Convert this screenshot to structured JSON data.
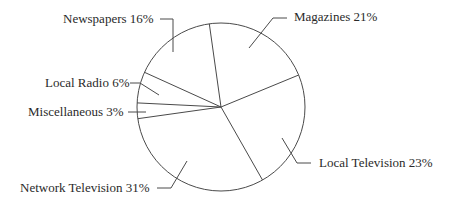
{
  "chart_data": {
    "type": "pie",
    "title": "",
    "start_angle_deg": -8,
    "direction": "clockwise",
    "slices": [
      {
        "label": "Magazines",
        "value": 21,
        "text": "Magazines 21%"
      },
      {
        "label": "Local Television",
        "value": 23,
        "text": "Local Television 23%"
      },
      {
        "label": "Network Television",
        "value": 31,
        "text": "Network Television 31%"
      },
      {
        "label": "Miscellaneous",
        "value": 3,
        "text": "Miscellaneous 3%"
      },
      {
        "label": "Local Radio",
        "value": 6,
        "text": "Local Radio 6%"
      },
      {
        "label": "Newspapers",
        "value": 16,
        "text": "Newspapers 16%"
      }
    ],
    "fill": "#ffffff",
    "stroke": "#4a4a4a",
    "legend": "none (leader-line labels)"
  },
  "labels": {
    "newspapers": "Newspapers 16%",
    "magazines": "Magazines 21%",
    "local_radio": "Local Radio 6%",
    "miscellaneous": "Miscellaneous 3%",
    "local_television": "Local Television 23%",
    "network_television": "Network Television 31%"
  }
}
